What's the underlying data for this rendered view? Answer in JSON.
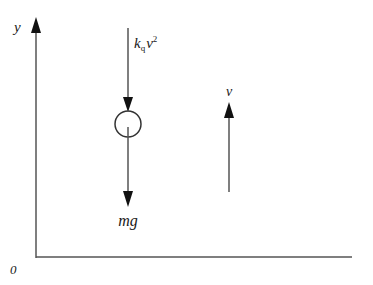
{
  "diagram": {
    "axes": {
      "y_label": "y",
      "origin_label": "0"
    },
    "forces": {
      "drag": {
        "label_base": "k",
        "label_sub": "q",
        "label_var": "v",
        "label_sup": "2",
        "direction": "down"
      },
      "gravity": {
        "label": "mg",
        "direction": "down"
      }
    },
    "velocity": {
      "label": "v",
      "direction": "up"
    },
    "colors": {
      "line": "#555555",
      "arrowhead": "#111111",
      "text": "#1a1a1a",
      "background": "#ffffff"
    }
  }
}
